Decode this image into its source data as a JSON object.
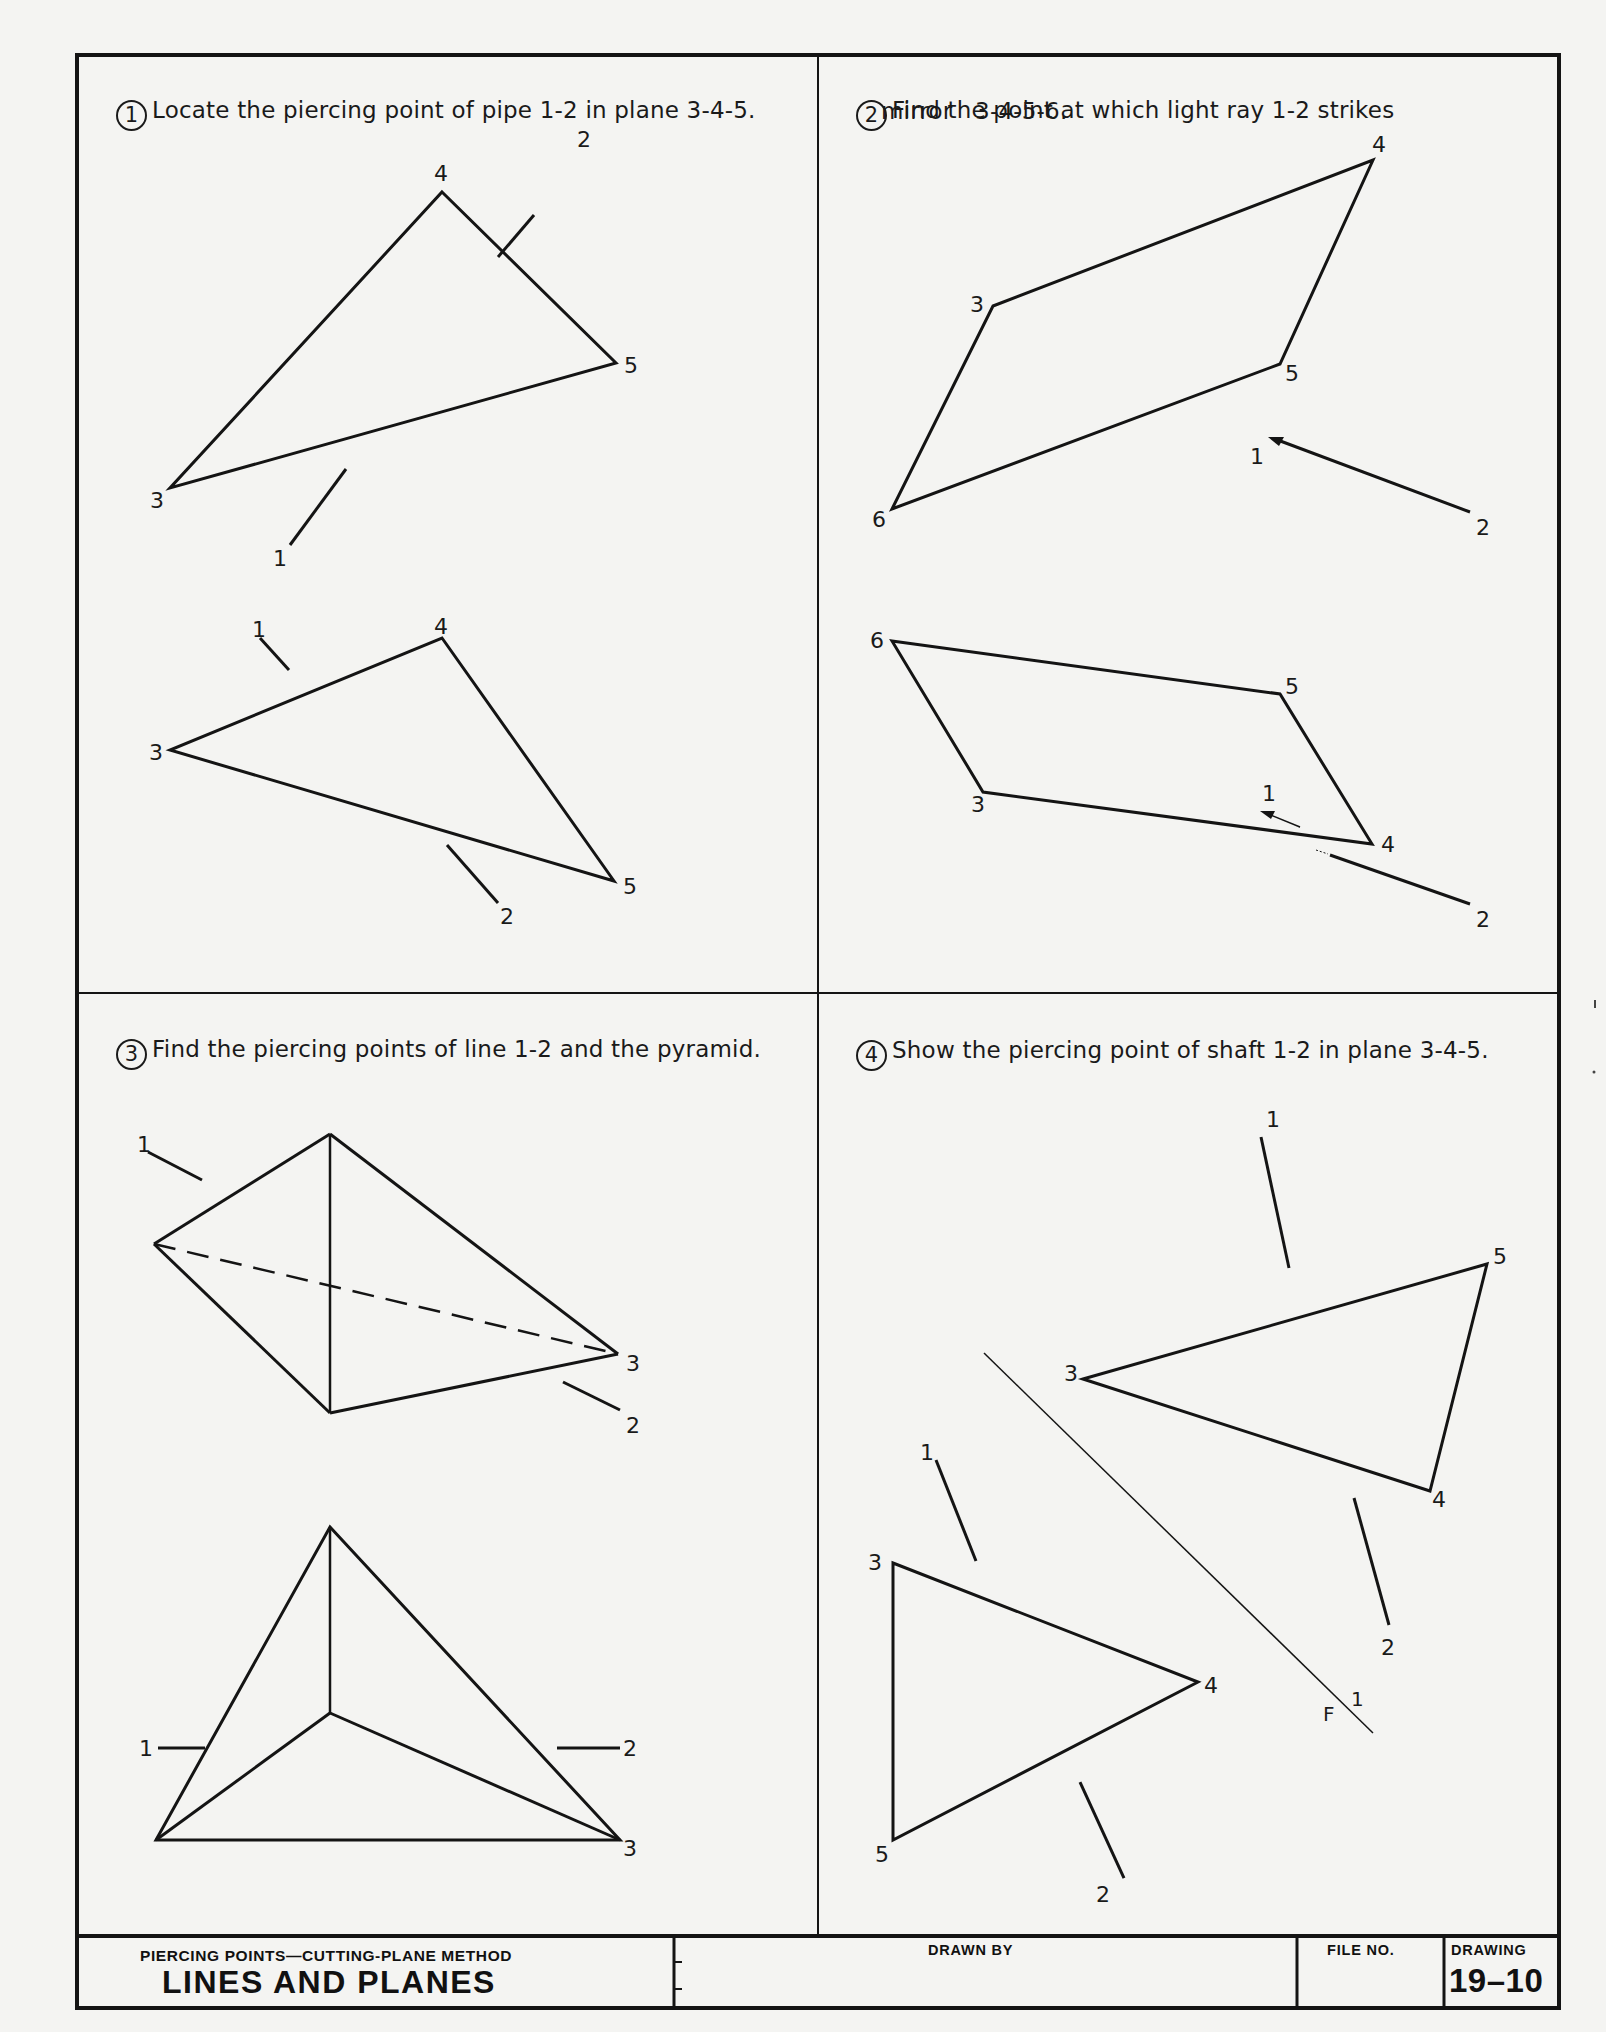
{
  "sheet": {
    "drawing_label": "DRAWING",
    "drawing_number": "19–10",
    "file_no_label": "FILE NO.",
    "drawn_by_label": "DRAWN BY",
    "subtitle": "PIERCING POINTS—CUTTING-PLANE METHOD",
    "title": "LINES AND PLANES"
  },
  "problems": [
    {
      "number": "1",
      "text": "Locate the piercing point of pipe 1-2 in plane 3-4-5.",
      "line1": "Locate the piercing point of pipe 1-2 in plane 3-4-5.",
      "views": {
        "top": {
          "points": {
            "1": "1",
            "2": "2",
            "3": "3",
            "4": "4",
            "5": "5"
          }
        },
        "front": {
          "points": {
            "1": "1",
            "2": "2",
            "3": "3",
            "4": "4",
            "5": "5"
          }
        }
      }
    },
    {
      "number": "2",
      "line1": "Find the point at which light ray 1-2 strikes",
      "line2": "mirror   3-4-5-6.",
      "views": {
        "top": {
          "points": {
            "1": "1",
            "2": "2",
            "3": "3",
            "4": "4",
            "5": "5",
            "6": "6"
          }
        },
        "front": {
          "points": {
            "1": "1",
            "2": "2",
            "3": "3",
            "4": "4",
            "5": "5",
            "6": "6"
          }
        }
      }
    },
    {
      "number": "3",
      "line1": "Find the piercing points of line 1-2 and the pyramid.",
      "views": {
        "top": {
          "points": {
            "1": "1",
            "2": "2",
            "3": "3"
          }
        },
        "front": {
          "points": {
            "1": "1",
            "2": "2",
            "3": "3"
          }
        }
      }
    },
    {
      "number": "4",
      "line1": "Show the piercing point of shaft 1-2 in plane 3-4-5.",
      "views": {
        "upper": {
          "points": {
            "1": "1",
            "2": "2",
            "3": "3",
            "4": "4",
            "5": "5"
          }
        },
        "lower": {
          "points": {
            "1": "1",
            "2": "2",
            "3": "3",
            "4": "4",
            "5": "5"
          }
        },
        "fold_line": {
          "label_f": "F",
          "label_1": "1"
        }
      }
    }
  ]
}
